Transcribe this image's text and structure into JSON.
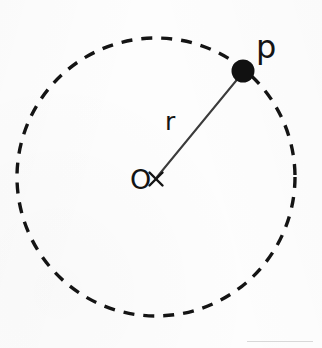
{
  "figure": {
    "background_color": "#fdfdfd",
    "stroke_color": "#141414",
    "radius_line_color": "#3b3b3b",
    "scan_line_color": "#d8d8d8"
  },
  "labels": {
    "center": "O",
    "radius": "r",
    "point": "p"
  },
  "geometry": {
    "circle": {
      "center_x": 156,
      "center_y": 177,
      "radius": 139,
      "stroke_width": 3.4,
      "dash_length": 11,
      "dash_gap": 9,
      "style": "dashed"
    },
    "center_marker": {
      "symbol": "x",
      "x": 156,
      "y": 179,
      "arm_length": 7,
      "stroke_width": 2.4
    },
    "point_p": {
      "x": 243,
      "y": 71,
      "dot_radius": 11.5,
      "fill": "#111111"
    },
    "radius_line": {
      "x1": 157,
      "y1": 177,
      "x2": 240,
      "y2": 76,
      "stroke_width": 2.0
    },
    "label_positions": {
      "center_label": {
        "x": 130,
        "y": 189,
        "font_size": 27
      },
      "radius_label": {
        "x": 165,
        "y": 130,
        "font_size": 25
      },
      "point_label": {
        "x": 256,
        "y": 58,
        "font_size": 32
      }
    }
  }
}
